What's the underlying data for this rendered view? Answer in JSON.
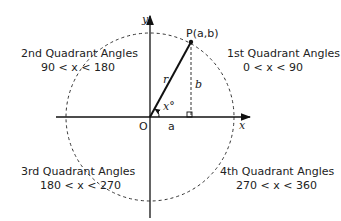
{
  "diagram": {
    "axes": {
      "x_label": "x",
      "y_label": "y",
      "origin_label": "O"
    },
    "point": {
      "label": "P(a,b)"
    },
    "segments": {
      "radius_label": "r",
      "horizontal_label": "a",
      "vertical_label": "b",
      "angle_label": "x°"
    },
    "quadrants": [
      {
        "title": "1st  Quadrant Angles",
        "range": "0 < x < 90"
      },
      {
        "title": "2nd  Quadrant Angles",
        "range": "90 < x < 180"
      },
      {
        "title": "3rd  Quadrant Angles",
        "range": "180 < x < 270"
      },
      {
        "title": "4th  Quadrant Angles",
        "range": "270 < x < 360"
      }
    ]
  }
}
